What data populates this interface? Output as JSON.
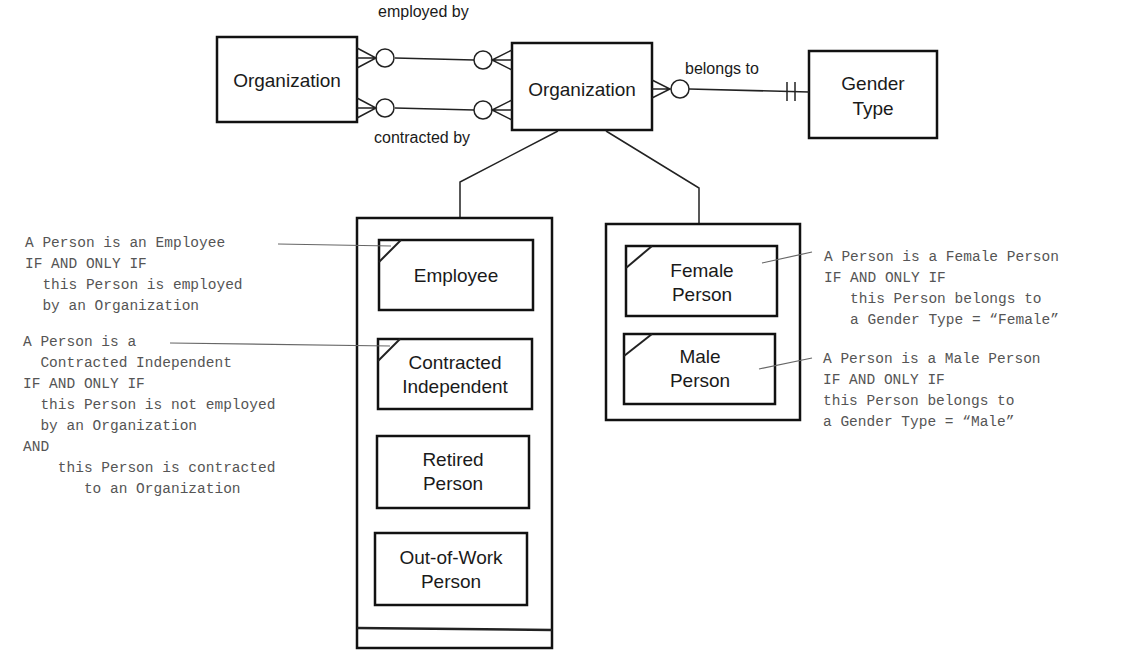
{
  "entities": {
    "org_left": {
      "label": "Organization"
    },
    "org_center": {
      "label": "Organization"
    },
    "gender_type": {
      "line1": "Gender",
      "line2": "Type"
    }
  },
  "relationships": {
    "employed_by": "employed by",
    "contracted_by": "contracted by",
    "belongs_to": "belongs to"
  },
  "subtype_group_1": {
    "items": [
      {
        "line1": "Employee",
        "line2": ""
      },
      {
        "line1": "Contracted",
        "line2": "Independent"
      },
      {
        "line1": "Retired",
        "line2": "Person"
      },
      {
        "line1": "Out-of-Work",
        "line2": "Person"
      }
    ]
  },
  "subtype_group_2": {
    "items": [
      {
        "line1": "Female",
        "line2": "Person"
      },
      {
        "line1": "Male",
        "line2": "Person"
      }
    ]
  },
  "notes": {
    "employee": [
      "A Person is an Employee",
      "IF AND ONLY IF",
      "  this Person is employed",
      "  by an Organization"
    ],
    "contracted": [
      "A Person is a",
      "  Contracted Independent",
      "IF AND ONLY IF",
      "  this Person is not employed",
      "  by an Organization",
      "AND",
      "    this Person is contracted",
      "       to an Organization"
    ],
    "female": [
      "A Person is a Female Person",
      "IF AND ONLY IF",
      "   this Person belongs to",
      "   a Gender Type = “Female”"
    ],
    "male": [
      "A Person is a Male Person",
      "IF AND ONLY IF",
      "this Person belongs to",
      "a Gender Type = “Male”"
    ]
  }
}
